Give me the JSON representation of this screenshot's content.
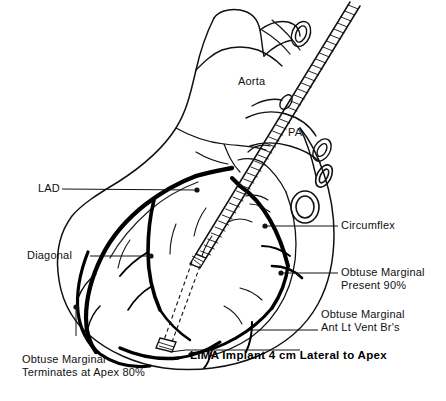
{
  "figure": {
    "background_color": "#ffffff",
    "ink_color": "#000000",
    "width": 446,
    "height": 401
  },
  "anatomy_labels": {
    "aorta": "Aorta",
    "pa": "PA"
  },
  "callouts": {
    "lad": "LAD",
    "diagonal": "Diagonal",
    "circumflex": "Circumflex",
    "obtuse_marginal_present_line1": "Obtuse Marginal",
    "obtuse_marginal_present_line2": "Present 90%",
    "obtuse_marginal_ant_line1": "Obtuse Marginal",
    "obtuse_marginal_ant_line2": "Ant Lt Vent Br's",
    "obtuse_marginal_term_line1": "Obtuse Marginal",
    "obtuse_marginal_term_line2": "Terminates at Apex 80%"
  },
  "caption": {
    "lima_implant": "LIMA Implant 4 cm Lateral to Apex"
  }
}
